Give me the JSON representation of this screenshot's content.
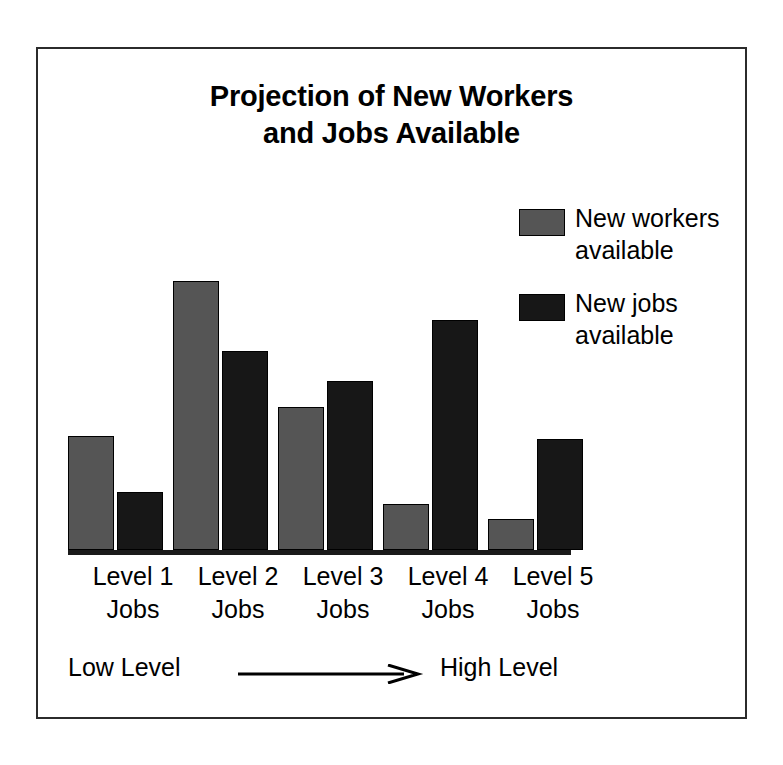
{
  "title": {
    "line1": "Projection of New Workers",
    "line2": "and Jobs Available"
  },
  "legend": {
    "position": "top-right",
    "entries": [
      {
        "label": "New workers\navailable",
        "color": "#555555",
        "icon": "legend-swatch-icon"
      },
      {
        "label": "New jobs\navailable",
        "color": "#171717",
        "icon": "legend-swatch-icon"
      }
    ]
  },
  "axis_note": {
    "low": "Low Level",
    "high": "High Level",
    "arrow_icon": "right-arrow-icon"
  },
  "colors": {
    "workers": "#555555",
    "jobs": "#171717",
    "axis": "#1a1a1a",
    "frame": "#2b2b2b",
    "background": "#ffffff",
    "text": "#000000"
  },
  "chart_data": {
    "type": "bar",
    "title": "Projection of New Workers and Jobs Available",
    "xlabel": "",
    "ylabel": "",
    "grid": false,
    "legend_position": "top-right",
    "axis_annotation": "Low Level → High Level",
    "categories": [
      "Level 1\nJobs",
      "Level 2\nJobs",
      "Level 3\nJobs",
      "Level 4\nJobs",
      "Level 5\nJobs"
    ],
    "category_lines": [
      [
        "Level 1",
        "Jobs"
      ],
      [
        "Level 2",
        "Jobs"
      ],
      [
        "Level 3",
        "Jobs"
      ],
      [
        "Level 4",
        "Jobs"
      ],
      [
        "Level 5",
        "Jobs"
      ]
    ],
    "ylim": [
      0,
      260
    ],
    "yticks_visible": false,
    "series": [
      {
        "name": "New workers available",
        "color": "#555555",
        "values": [
          107,
          253,
          135,
          43,
          29
        ]
      },
      {
        "name": "New jobs available",
        "color": "#171717",
        "values": [
          55,
          187,
          159,
          217,
          105
        ]
      }
    ]
  },
  "geometry": {
    "bar_width": 46,
    "group_starts": [
      0,
      105,
      210,
      315,
      420
    ],
    "jobs_offset": 49,
    "xlabel_positions": [
      12,
      117,
      222,
      327,
      432
    ],
    "xlabel_width": 130
  }
}
